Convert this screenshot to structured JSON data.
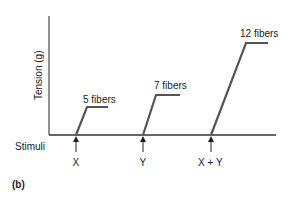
{
  "diagram": {
    "y_axis_label": "Tension (g)",
    "baseline_label": "Stimuli",
    "panel_label": "(b)",
    "line_color": "#555555",
    "responses": [
      {
        "label": "5 fibers",
        "stimulus": "X"
      },
      {
        "label": "7 fibers",
        "stimulus": "Y"
      },
      {
        "label": "12 fibers",
        "stimulus": "X + Y"
      }
    ]
  }
}
